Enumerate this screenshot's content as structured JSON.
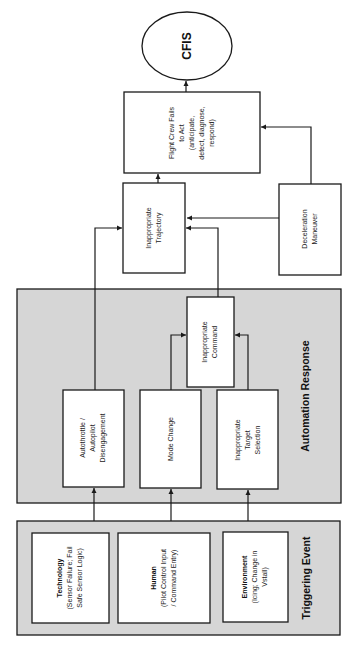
{
  "diagram": {
    "orientation": "rotated-90-ccw",
    "colors": {
      "group_fill": "#d6d6d6",
      "box_fill": "#ffffff",
      "stroke": "#1a1a1a"
    },
    "outcome": {
      "label": "CFIS",
      "shape": "ellipse"
    },
    "flight_crew": {
      "lines": [
        "Flight Crew Fails",
        "to Act",
        "(anticipate,",
        "detect, diagnose,",
        "respond)"
      ]
    },
    "inappropriate_trajectory": {
      "lines": [
        "Inappropriate",
        "Trajectory"
      ]
    },
    "deceleration_maneuver": {
      "lines": [
        "Deceleration",
        "Maneuver"
      ]
    },
    "automation_response": {
      "title": "Automation Response",
      "inappropriate_command": {
        "lines": [
          "Inappropriate",
          "Command"
        ]
      },
      "autothrottle": {
        "lines": [
          "Autothrottle /",
          "Autopilot",
          "Disengagement"
        ]
      },
      "mode_change": {
        "lines": [
          "Mode Change"
        ]
      },
      "target_selection": {
        "lines": [
          "Inappropriate",
          "Target",
          "Selection"
        ]
      }
    },
    "triggering_event": {
      "title": "Triggering Event",
      "technology": {
        "name": "Technology",
        "lines": [
          "(Sensor Failure; Fail",
          "Safe Sensor Logic)"
        ]
      },
      "human": {
        "name": "Human",
        "lines": [
          "(Pilot Control Input",
          "/ Command Entry)"
        ]
      },
      "environment": {
        "name": "Environment",
        "lines": [
          "(Icing; Change in",
          "Vstall)"
        ]
      }
    },
    "edges": [
      [
        "Technology",
        "Autothrottle / Autopilot Disengagement"
      ],
      [
        "Human",
        "Mode Change"
      ],
      [
        "Environment",
        "Inappropriate Target Selection"
      ],
      [
        "Mode Change",
        "Inappropriate Command"
      ],
      [
        "Inappropriate Target Selection",
        "Inappropriate Command"
      ],
      [
        "Autothrottle / Autopilot Disengagement",
        "Inappropriate Trajectory"
      ],
      [
        "Inappropriate Command",
        "Inappropriate Trajectory"
      ],
      [
        "Deceleration Maneuver",
        "Inappropriate Trajectory"
      ],
      [
        "Deceleration Maneuver",
        "Flight Crew Fails to Act"
      ],
      [
        "Inappropriate Trajectory",
        "Flight Crew Fails to Act"
      ],
      [
        "Flight Crew Fails to Act",
        "CFIS"
      ]
    ]
  }
}
